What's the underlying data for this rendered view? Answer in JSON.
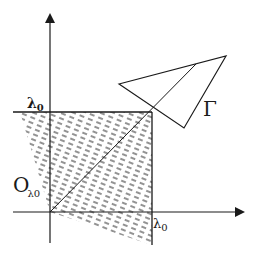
{
  "diagram": {
    "colors": {
      "ink": "#1a1a1a",
      "hatch": "#3a3a3a",
      "background": "#ffffff"
    },
    "labels": {
      "y_tick": "λ",
      "y_tick_sub": "0",
      "x_tick": "λ",
      "x_tick_sub": "0",
      "origin": "O",
      "origin_sub": "λ0",
      "gamma": "Γ"
    },
    "axes": {
      "origin": [
        50,
        212
      ],
      "x_arrow_tip": [
        245,
        212
      ],
      "y_arrow_tip": [
        50,
        13
      ]
    },
    "square": {
      "lambda0_x": 152,
      "lambda0_y": 112
    },
    "shaded_region": [
      [
        20,
        112
      ],
      [
        152,
        112
      ],
      [
        152,
        245
      ],
      [
        50,
        212
      ]
    ],
    "triangle_gamma": [
      [
        119,
        84
      ],
      [
        226,
        56
      ],
      [
        184,
        128
      ]
    ],
    "diagonal": {
      "from": [
        50,
        212
      ],
      "to": [
        196,
        64
      ]
    }
  }
}
